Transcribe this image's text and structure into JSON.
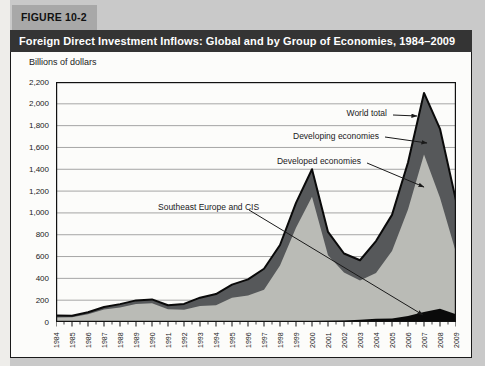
{
  "figure": {
    "tab_label": "FIGURE 10-2",
    "title": "Foreign Direct Investment Inflows: Global and by Group of Economies, 1984–2009"
  },
  "chart_data": {
    "type": "area",
    "title": "Foreign Direct Investment Inflows: Global and by Group of Economies, 1984–2009",
    "units_label": "Billions of dollars",
    "xlabel": "",
    "ylabel": "Billions of dollars",
    "ylim": [
      0,
      2200
    ],
    "ytick_step": 200,
    "grid": "horizontal",
    "legend_position": "inline-annotations",
    "x": [
      1984,
      1985,
      1986,
      1987,
      1988,
      1989,
      1990,
      1991,
      1992,
      1993,
      1994,
      1995,
      1996,
      1997,
      1998,
      1999,
      2000,
      2001,
      2002,
      2003,
      2004,
      2005,
      2006,
      2007,
      2008,
      2009
    ],
    "series": [
      {
        "name": "World total",
        "role": "total-outline-and-dark-area",
        "color": "#56585a",
        "values": [
          59,
          57,
          89,
          137,
          164,
          198,
          207,
          154,
          166,
          223,
          256,
          343,
          391,
          488,
          706,
          1092,
          1400,
          826,
          628,
          566,
          742,
          982,
          1462,
          2100,
          1771,
          1114
        ]
      },
      {
        "name": "Developed economies",
        "role": "light-area",
        "color": "#babbb6",
        "values": [
          42,
          43,
          71,
          115,
          133,
          165,
          172,
          115,
          111,
          143,
          151,
          219,
          236,
          285,
          508,
          853,
          1138,
          601,
          441,
          361,
          419,
          619,
          977,
          1444,
          1018,
          566
        ]
      },
      {
        "name": "Developing economies",
        "role": "visible-dark-band-between-developed-and-world",
        "color": "#56585a",
        "values": [
          17,
          14,
          18,
          22,
          31,
          33,
          35,
          38,
          53,
          77,
          103,
          120,
          149,
          193,
          189,
          229,
          253,
          213,
          174,
          185,
          293,
          332,
          430,
          565,
          632,
          478
        ]
      },
      {
        "name": "Southeast Europe and CIS",
        "role": "black-bottom-band",
        "color": "#0a0a0a",
        "values": [
          0,
          0,
          0,
          0,
          0,
          0,
          0,
          1,
          2,
          3,
          2,
          4,
          6,
          10,
          9,
          10,
          9,
          12,
          13,
          20,
          30,
          31,
          55,
          91,
          121,
          70
        ]
      }
    ],
    "annotations": [
      {
        "label": "World total",
        "anchor": "right",
        "x": 378,
        "y": 62,
        "arrow": [
          382,
          63,
          406,
          64
        ]
      },
      {
        "label": "Developing economies",
        "anchor": "right",
        "x": 370,
        "y": 85,
        "arrow": [
          374,
          85,
          416,
          91
        ]
      },
      {
        "label": "Developed economies",
        "anchor": "right",
        "x": 352,
        "y": 110,
        "arrow": [
          356,
          111,
          413,
          135
        ]
      },
      {
        "label": "Southeast Europe and CIS",
        "anchor": "left",
        "x": 147,
        "y": 156,
        "arrow": [
          238,
          158,
          412,
          263
        ]
      }
    ]
  }
}
